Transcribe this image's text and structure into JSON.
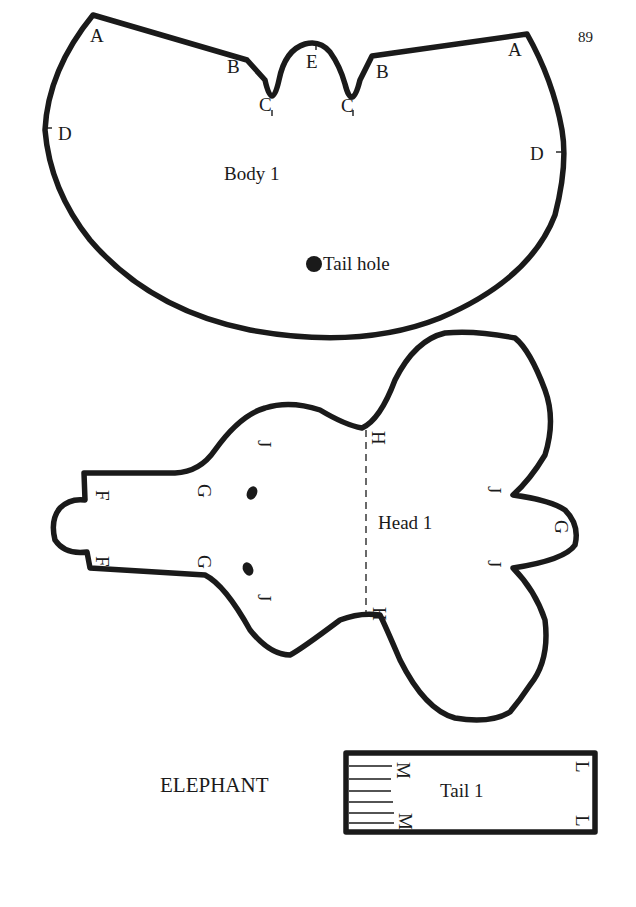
{
  "page": {
    "page_number": "89",
    "caption": "ELEPHANT"
  },
  "body_piece": {
    "title": "Body 1",
    "tail_hole_label": "Tail hole",
    "marks": {
      "a_left": "A",
      "a_right": "A",
      "b_left": "B",
      "b_right": "B",
      "c_left": "C",
      "c_right": "C",
      "d_left": "D",
      "d_right": "D",
      "e": "E"
    }
  },
  "head_piece": {
    "title": "Head 1",
    "marks": {
      "f_top": "F",
      "f_bottom": "F",
      "g_top": "G",
      "g_bottom": "G",
      "g_right": "G",
      "h_top": "H",
      "h_bottom": "H",
      "j_top_left": "J",
      "j_bottom_left": "J",
      "j_top_right": "J",
      "j_bottom_right": "J"
    }
  },
  "tail_piece": {
    "title": "Tail 1",
    "marks": {
      "m_top": "M",
      "m_bottom": "M",
      "l_top": "L",
      "l_bottom": "L"
    }
  }
}
